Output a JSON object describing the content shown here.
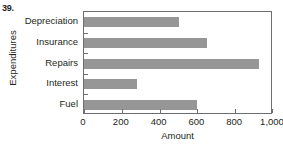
{
  "problem": {
    "number": "39.",
    "cropped_header_text": ""
  },
  "chart_data": {
    "type": "bar",
    "orientation": "horizontal",
    "title": "",
    "xlabel": "Amount",
    "ylabel": "Expenditures",
    "categories": [
      "Depreciation",
      "Insurance",
      "Repairs",
      "Interest",
      "Fuel"
    ],
    "values": [
      500,
      650,
      925,
      280,
      600
    ],
    "xlim": [
      0,
      1000
    ],
    "xticks": [
      0,
      200,
      400,
      600,
      800,
      1000
    ],
    "xtick_labels": [
      "0",
      "200",
      "400",
      "600",
      "800",
      "1,000"
    ],
    "grid": false,
    "legend": null,
    "bar_color": "#969696",
    "axis_color": "#6d6e71",
    "background_color": "#ffffff"
  }
}
